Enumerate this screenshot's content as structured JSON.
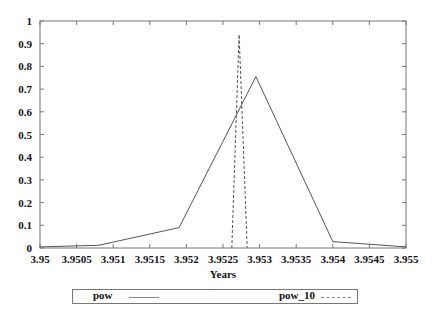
{
  "chart_data": {
    "type": "line",
    "title": "",
    "xlabel": "Years",
    "ylabel": "",
    "xlim": [
      3.95,
      3.955
    ],
    "ylim": [
      0,
      1
    ],
    "grid": false,
    "legend_position": "bottom",
    "x_ticks": [
      "3.95",
      "3.9505",
      "3.951",
      "3.9515",
      "3.952",
      "3.9525",
      "3.953",
      "3.9535",
      "3.954",
      "3.9545",
      "3.955"
    ],
    "y_ticks": [
      "0",
      "0.1",
      "0.2",
      "0.3",
      "0.4",
      "0.5",
      "0.6",
      "0.7",
      "0.8",
      "0.9",
      "1"
    ],
    "series": [
      {
        "name": "pow",
        "style": "solid",
        "color": "#555555",
        "x": [
          3.95,
          3.9508,
          3.9519,
          3.95295,
          3.954,
          3.955
        ],
        "y": [
          0.005,
          0.012,
          0.09,
          0.755,
          0.028,
          0.005
        ]
      },
      {
        "name": "pow_10",
        "style": "dashed",
        "color": "#555555",
        "x": [
          3.95262,
          3.95272,
          3.95283
        ],
        "y": [
          0.0,
          0.94,
          0.0
        ]
      }
    ]
  },
  "legend": {
    "items": [
      {
        "label": "pow",
        "style": "solid"
      },
      {
        "label": "pow_10",
        "style": "dashed"
      }
    ]
  }
}
